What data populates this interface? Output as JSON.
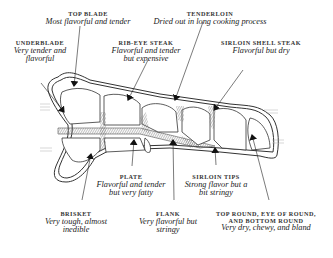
{
  "diagram": {
    "type": "beef cuts cross-section illustration",
    "labels": [
      {
        "id": "top-blade",
        "title": "TOP BLADE",
        "desc": [
          "Most flavorful and tender"
        ]
      },
      {
        "id": "tenderloin",
        "title": "TENDERLOIN",
        "desc": [
          "Dried out in long cooking process"
        ]
      },
      {
        "id": "underblade",
        "title": "UNDERBLADE",
        "desc": [
          "Very tender and",
          "flavorful"
        ]
      },
      {
        "id": "rib-eye",
        "title": "RIB-EYE STEAK",
        "desc": [
          "Flavorful and tender",
          "but expensive"
        ]
      },
      {
        "id": "sirloin-shell",
        "title": "SIRLOIN SHELL STEAK",
        "desc": [
          "Flavorful but dry"
        ]
      },
      {
        "id": "plate",
        "title": "PLATE",
        "desc": [
          "Flavorful and tender",
          "but very fatty"
        ]
      },
      {
        "id": "sirloin-tips",
        "title": "SIRLOIN TIPS",
        "desc": [
          "Strong flavor but a",
          "bit stringy"
        ]
      },
      {
        "id": "brisket",
        "title": "BRISKET",
        "desc": [
          "Very tough, almost",
          "inedible"
        ]
      },
      {
        "id": "flank",
        "title": "FLANK",
        "desc": [
          "Very flavorful but",
          "stringy"
        ]
      },
      {
        "id": "round",
        "title": [
          "TOP ROUND, EYE OF ROUND,",
          "AND BOTTOM ROUND"
        ],
        "desc": [
          "Very dry, chewy, and bland"
        ]
      }
    ]
  }
}
